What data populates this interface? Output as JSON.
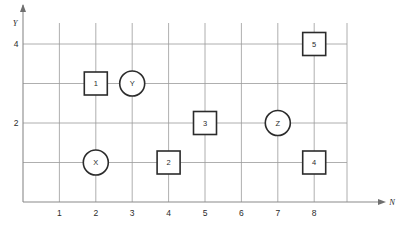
{
  "figure": {
    "title": "",
    "background_color": "#ffffff"
  },
  "axes": {
    "x_axis_label": "N",
    "y_axis_label": "Y",
    "x_ticks": [
      "1",
      "2",
      "3",
      "4",
      "5",
      "6",
      "7",
      "8"
    ],
    "y_ticks": [
      "2",
      "4"
    ],
    "x_tick_values": [
      1,
      2,
      3,
      4,
      5,
      6,
      7,
      8
    ],
    "y_tick_values": [
      2,
      4
    ],
    "grid": true,
    "grid_color": "#9a9a9a",
    "axis_color": "#8a8a8a",
    "xlim": [
      0.4,
      9.0
    ],
    "ylim": [
      0.0,
      5.6
    ]
  },
  "chart_data": {
    "type": "scatter",
    "title": "",
    "xlabel": "N",
    "ylabel": "Y",
    "xlim": [
      0.4,
      9.0
    ],
    "ylim": [
      0.0,
      5.6
    ],
    "grid": true,
    "legend": "none",
    "x_tick_labels": [
      "1",
      "2",
      "3",
      "4",
      "5",
      "6",
      "7",
      "8"
    ],
    "y_tick_labels": [
      "2",
      "4"
    ],
    "series": [
      {
        "name": "squares",
        "marker": "square",
        "points": [
          {
            "label": "1",
            "x": 2,
            "y": 3
          },
          {
            "label": "2",
            "x": 4,
            "y": 1
          },
          {
            "label": "3",
            "x": 5,
            "y": 2
          },
          {
            "label": "4",
            "x": 8,
            "y": 1
          },
          {
            "label": "5",
            "x": 8,
            "y": 4
          }
        ]
      },
      {
        "name": "circles",
        "marker": "circle",
        "points": [
          {
            "label": "X",
            "x": 2,
            "y": 1
          },
          {
            "label": "Y",
            "x": 3,
            "y": 3
          },
          {
            "label": "Z",
            "x": 7,
            "y": 2
          }
        ]
      }
    ],
    "marker_stroke_color": "#2b2b2b",
    "marker_fill_color": "#ffffff"
  }
}
